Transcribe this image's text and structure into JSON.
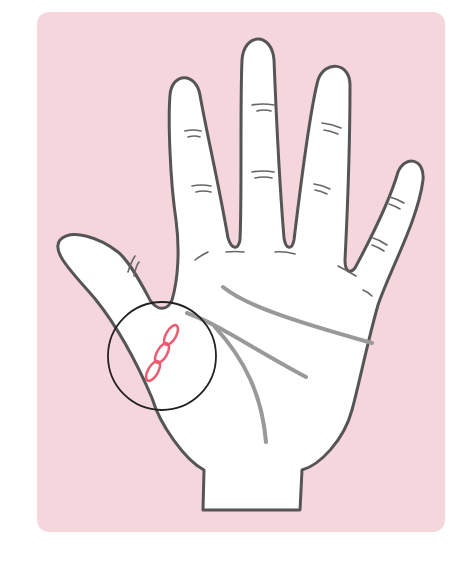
{
  "illustration": {
    "subject": "open palm hand with palmistry lines",
    "highlight": "chain-like mark at base of thumb crease inside circle",
    "colors": {
      "background": "#ffffff",
      "card": "#f6d6dd",
      "hand_fill": "#ffffff",
      "outline": "#555555",
      "palm_lines": "#999999",
      "highlight_circle": "#222222",
      "chain_mark": "#ef5a6e"
    },
    "elements": [
      "thumb",
      "index-finger",
      "middle-finger",
      "ring-finger",
      "little-finger",
      "heart-line",
      "head-line",
      "life-line",
      "magnifier-circle",
      "chain-mark"
    ]
  }
}
